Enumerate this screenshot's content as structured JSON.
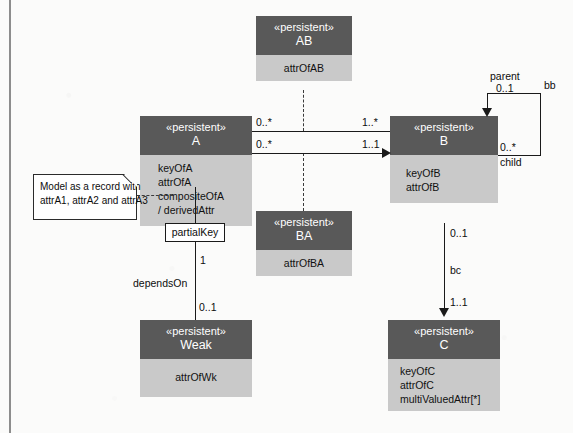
{
  "diagram": {
    "colors": {
      "class_header": "#595959",
      "class_body": "#c9c9c9",
      "line": "#1a1a1a",
      "note_bg": "#ffffff",
      "page_bg": "#fbfbfa"
    }
  },
  "classes": {
    "ab": {
      "stereotype": "«persistent»",
      "name": "AB",
      "attributes": [
        "attrOfAB"
      ]
    },
    "a": {
      "stereotype": "«persistent»",
      "name": "A",
      "attributes": [
        "keyOfA",
        "attrOfA",
        "compositeOfA",
        "/ derivedAttr"
      ]
    },
    "b": {
      "stereotype": "«persistent»",
      "name": "B",
      "attributes": [
        "keyOfB",
        "attrOfB"
      ]
    },
    "ba": {
      "stereotype": "«persistent»",
      "name": "BA",
      "attributes": [
        "attrOfBA"
      ]
    },
    "weak": {
      "stereotype": "«persistent»",
      "name": "Weak",
      "attributes": [
        "attrOfWk"
      ]
    },
    "c": {
      "stereotype": "«persistent»",
      "name": "C",
      "attributes": [
        "keyOfC",
        "attrOfC",
        "multiValuedAttr[*]"
      ]
    }
  },
  "note": {
    "line1": "Model as a record with",
    "line2": "attrA1, attrA2 and attrA3"
  },
  "labels": {
    "assoc_ab_left_mult": "0..*",
    "assoc_ab_right_mult": "1..*",
    "assoc_ba_left_mult": "0..*",
    "assoc_ba_right_mult": "1..1",
    "self_assoc_name": "bb",
    "self_parent_role": "parent",
    "self_parent_mult": "0..1",
    "self_child_mult": "0..*",
    "self_child_role": "child",
    "bc_assoc_name": "bc",
    "bc_top_mult": "0..1",
    "bc_bottom_mult": "1..1",
    "partial_key": "partialKey",
    "depends_on": "dependsOn",
    "depends_top_mult": "1",
    "depends_bottom_mult": "0..1"
  }
}
